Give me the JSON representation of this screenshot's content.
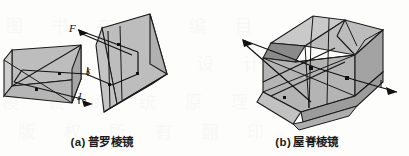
{
  "figure": {
    "background_color": "#fdfdfc",
    "panels": [
      {
        "id": "porro-prism",
        "caption_index": "(a)",
        "caption_text": "普罗棱镜",
        "labels": {
          "incoming_ray": "F",
          "outgoing_ray": "J",
          "mid_ray": "k"
        }
      },
      {
        "id": "roof-prism",
        "caption_index": "(b)",
        "caption_text": "屋脊棱镜",
        "labels": {
          "incoming_ray": "F",
          "outgoing_ray": "J"
        }
      }
    ],
    "colors": {
      "face_light": "#c9c9c9",
      "face_mid": "#b3b3b3",
      "face_dark": "#9a9a9a",
      "face_darker": "#878787",
      "outline": "#1a1a1a",
      "ray": "#111111",
      "caption_text": "#1b1b1b"
    },
    "watermark": {
      "row_1": "图 书 在 版 编 目",
      "row_2": "光 学 仪 器 设 计",
      "row_3": "棱 镜 系 统 原 理",
      "row_4": "版 权 所 有 翻 印"
    }
  }
}
